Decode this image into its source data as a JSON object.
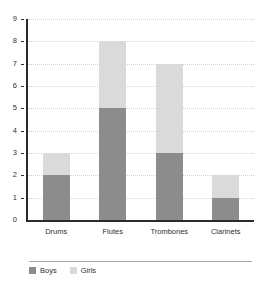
{
  "chart_data": {
    "type": "bar",
    "subtype": "stacked-bar",
    "title": "",
    "subtitle": "",
    "xlabel": "",
    "ylabel": "",
    "categories": [
      "Drums",
      "Flutes",
      "Trombones",
      "Clarinets"
    ],
    "series": [
      {
        "name": "Boys",
        "values": [
          2,
          5,
          3,
          1
        ],
        "color": "#8c8c8c"
      },
      {
        "name": "Girls",
        "values": [
          1,
          3,
          4,
          1
        ],
        "color": "#dadada"
      }
    ],
    "totals": [
      3,
      8,
      7,
      2
    ],
    "ylim": [
      0,
      9
    ],
    "ytick_step": 1,
    "ytick_labels": [
      "0",
      "1",
      "2",
      "3",
      "4",
      "5",
      "6",
      "7",
      "8",
      "9"
    ],
    "grid": true,
    "grid_axis": "y",
    "grid_style": "dotted",
    "legend_position": "bottom-left",
    "legend_entries": [
      "Boys",
      "Girls"
    ],
    "annotations": []
  },
  "colors": {
    "boys": "#8c8c8c",
    "girls": "#dadada",
    "axis": "#2b2b2b",
    "grid": "#d2d2d2",
    "text": "#2f2f2f",
    "legend_separator": "#aaaaaa",
    "background": "#ffffff"
  }
}
